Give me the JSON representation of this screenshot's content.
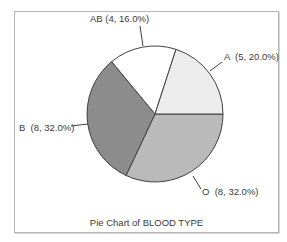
{
  "chart_data": {
    "type": "pie",
    "title": "Pie Chart of BLOOD TYPE",
    "categories": [
      "A",
      "AB",
      "B",
      "O"
    ],
    "values": [
      5,
      4,
      8,
      8
    ],
    "percentages": [
      20.0,
      16.0,
      32.0,
      32.0
    ],
    "total": 25,
    "labels": [
      "A  (5, 20.0%)",
      "AB (4, 16.0%)",
      "B  (8, 32.0%)",
      "O  (8, 32.0%)"
    ],
    "colors": {
      "A": "#ececec",
      "AB": "#ffffff",
      "B": "#8c8c8c",
      "O": "#bababa"
    },
    "legend": "none",
    "grid": false
  },
  "slice_labels": {
    "A": "A  (5, 20.0%)",
    "AB": "AB (4, 16.0%)",
    "B": "B  (8, 32.0%)",
    "O": "O  (8, 32.0%)"
  }
}
